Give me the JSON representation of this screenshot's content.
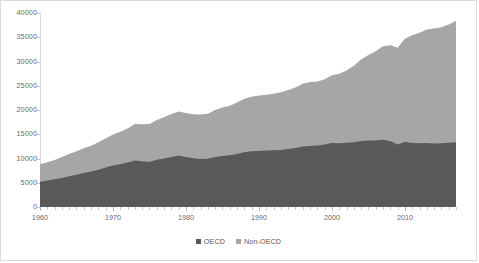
{
  "chart_data": {
    "type": "area",
    "stacked": true,
    "title": "",
    "subtitle": "",
    "xlabel": "",
    "ylabel": "",
    "xlim": [
      1960,
      2017
    ],
    "ylim": [
      0,
      40000
    ],
    "grid": false,
    "legend_position": "bottom",
    "x": [
      1960,
      1961,
      1962,
      1963,
      1964,
      1965,
      1966,
      1967,
      1968,
      1969,
      1970,
      1971,
      1972,
      1973,
      1974,
      1975,
      1976,
      1977,
      1978,
      1979,
      1980,
      1981,
      1982,
      1983,
      1984,
      1985,
      1986,
      1987,
      1988,
      1989,
      1990,
      1991,
      1992,
      1993,
      1994,
      1995,
      1996,
      1997,
      1998,
      1999,
      2000,
      2001,
      2002,
      2003,
      2004,
      2005,
      2006,
      2007,
      2008,
      2009,
      2010,
      2011,
      2012,
      2013,
      2014,
      2015,
      2016,
      2017
    ],
    "xticklabels": [
      "1960",
      "1970",
      "1980",
      "1990",
      "2000",
      "2010"
    ],
    "xticks": [
      1960,
      1970,
      1980,
      1990,
      2000,
      2010
    ],
    "yticklabels": [
      "0",
      "5000",
      "10000",
      "15000",
      "20000",
      "25000",
      "30000",
      "35000",
      "40000"
    ],
    "yticks": [
      0,
      5000,
      10000,
      15000,
      20000,
      25000,
      30000,
      35000,
      40000
    ],
    "series": [
      {
        "name": "OECD",
        "color": "#595959",
        "values": [
          5200,
          5450,
          5700,
          6000,
          6350,
          6650,
          7000,
          7300,
          7700,
          8150,
          8550,
          8800,
          9150,
          9600,
          9450,
          9300,
          9750,
          10000,
          10300,
          10600,
          10300,
          10050,
          9900,
          9950,
          10300,
          10500,
          10650,
          10950,
          11300,
          11500,
          11550,
          11650,
          11700,
          11750,
          11950,
          12150,
          12450,
          12600,
          12700,
          12900,
          13200,
          13150,
          13250,
          13350,
          13600,
          13700,
          13700,
          13850,
          13600,
          12900,
          13400,
          13200,
          13150,
          13200,
          13100,
          13150,
          13250,
          13350
        ]
      },
      {
        "name": "Non-OECD",
        "color": "#a6a6a6",
        "values": [
          3600,
          3800,
          4000,
          4300,
          4600,
          4850,
          5100,
          5350,
          5650,
          6000,
          6400,
          6700,
          7050,
          7500,
          7600,
          7800,
          8200,
          8500,
          8850,
          9100,
          9100,
          9050,
          9150,
          9300,
          9700,
          10000,
          10250,
          10600,
          11000,
          11250,
          11450,
          11500,
          11650,
          11900,
          12150,
          12500,
          12950,
          13150,
          13200,
          13450,
          13950,
          14300,
          14900,
          15750,
          16800,
          17650,
          18400,
          19300,
          19750,
          19950,
          21300,
          22200,
          22800,
          23400,
          23700,
          23900,
          24400,
          25000
        ]
      }
    ]
  },
  "legend": {
    "items": [
      {
        "label": "OECD",
        "color": "#595959"
      },
      {
        "label": "Non-OECD",
        "color": "#a6a6a6"
      }
    ]
  }
}
